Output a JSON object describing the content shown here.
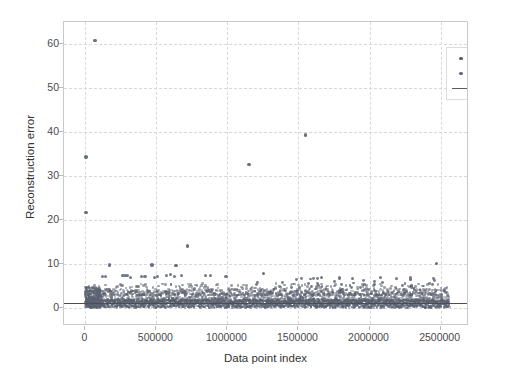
{
  "chart_data": {
    "type": "scatter",
    "title": "",
    "xlabel": "Data point index",
    "ylabel": "Reconstruction error",
    "xlim": [
      -150000,
      2700000
    ],
    "ylim": [
      -4,
      65
    ],
    "xticks": [
      0,
      500000,
      1000000,
      1500000,
      2000000,
      2500000
    ],
    "xticklabels": [
      "0",
      "500000",
      "1000000",
      "1500000",
      "2000000",
      "2500000"
    ],
    "yticks": [
      0,
      10,
      20,
      30,
      40,
      50,
      60
    ],
    "yticklabels": [
      "0",
      "10",
      "20",
      "30",
      "40",
      "50",
      "60"
    ],
    "grid": true,
    "grid_style": "dashed",
    "legend_position": "upper right",
    "legend": [
      {
        "label": "Normal",
        "marker": "dot",
        "color": "#545d6b"
      },
      {
        "label": "Attack",
        "marker": "dot",
        "color": "#5f6876"
      },
      {
        "label": "Threshold",
        "marker": "line",
        "color": "#5a5a5a"
      }
    ],
    "threshold": {
      "value": 1.3,
      "x_start": -150000,
      "x_end": 2700000
    },
    "series": [
      {
        "name": "Normal",
        "marker_color": "#5a6170",
        "description": "Dense band of points spanning the full index range, concentrated between 0 and about 5 reconstruction error, densest near 0-2.",
        "outliers": [
          {
            "x": 5000,
            "y": 21.8
          },
          {
            "x": 5000,
            "y": 34.3
          },
          {
            "x": 70000,
            "y": 60.8
          },
          {
            "x": 170000,
            "y": 9.9
          },
          {
            "x": 470000,
            "y": 9.9
          },
          {
            "x": 640000,
            "y": 9.7
          },
          {
            "x": 720000,
            "y": 14.2
          },
          {
            "x": 1150000,
            "y": 32.7
          },
          {
            "x": 1255000,
            "y": 7.9
          },
          {
            "x": 1550000,
            "y": 39.3
          },
          {
            "x": 2470000,
            "y": 10.2
          }
        ],
        "plateau_points": [
          {
            "x": 120000,
            "y": 7.2
          },
          {
            "x": 145000,
            "y": 7.3
          },
          {
            "x": 265000,
            "y": 7.4
          },
          {
            "x": 285000,
            "y": 7.5
          },
          {
            "x": 300000,
            "y": 7.4
          },
          {
            "x": 320000,
            "y": 7.1
          },
          {
            "x": 395000,
            "y": 7.2
          },
          {
            "x": 420000,
            "y": 7.2
          },
          {
            "x": 490000,
            "y": 7.1
          },
          {
            "x": 510000,
            "y": 7.3
          },
          {
            "x": 570000,
            "y": 7.5
          },
          {
            "x": 600000,
            "y": 7.6
          },
          {
            "x": 625000,
            "y": 7.3
          },
          {
            "x": 675000,
            "y": 7.4
          },
          {
            "x": 845000,
            "y": 7.5
          },
          {
            "x": 880000,
            "y": 7.4
          },
          {
            "x": 990000,
            "y": 7.3
          },
          {
            "x": 1660000,
            "y": 7.0
          },
          {
            "x": 1790000,
            "y": 6.9
          },
          {
            "x": 1880000,
            "y": 6.8
          },
          {
            "x": 2080000,
            "y": 7.0
          },
          {
            "x": 2190000,
            "y": 6.8
          },
          {
            "x": 2290000,
            "y": 6.9
          }
        ]
      }
    ]
  }
}
